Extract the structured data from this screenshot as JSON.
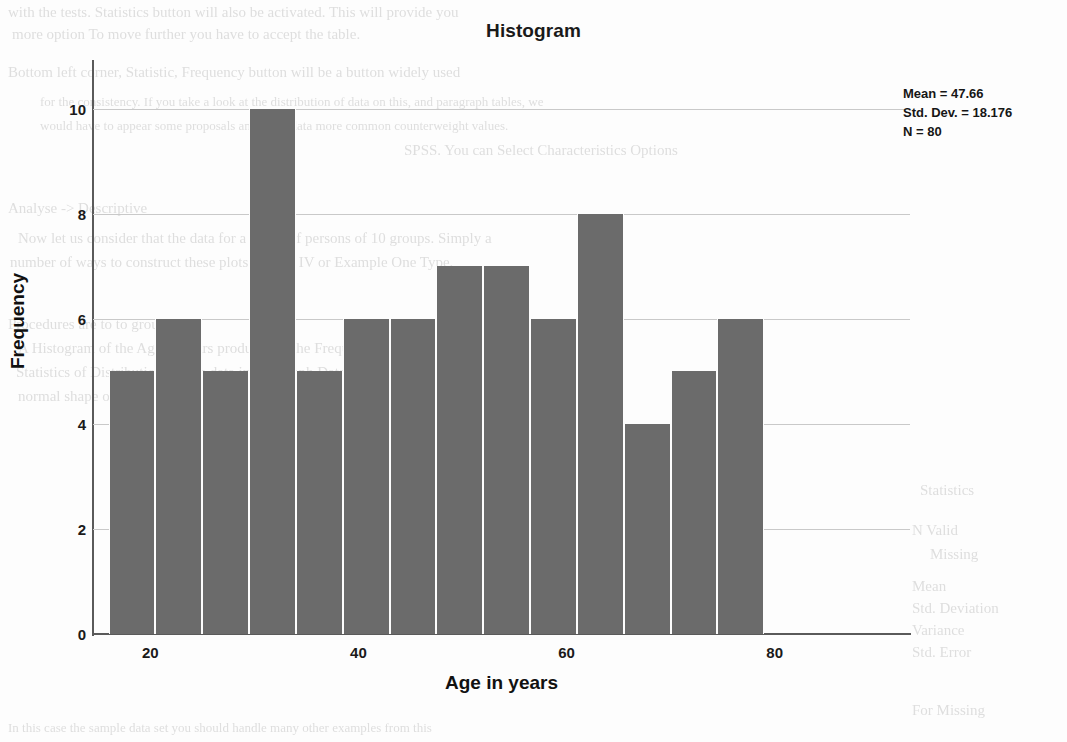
{
  "chart_data": {
    "type": "bar",
    "title": "Histogram",
    "xlabel": "Age in years",
    "ylabel": "Frequency",
    "grid": true,
    "legend_position": "none",
    "xlim": [
      14.5,
      93.0
    ],
    "ylim": [
      0,
      10.6
    ],
    "bin_width": 4.5,
    "bin_start": 16.0,
    "categories": [
      "16.0-20.5",
      "20.5-25.0",
      "25.0-29.5",
      "29.5-34.0",
      "34.0-38.5",
      "38.5-43.0",
      "43.0-47.5",
      "47.5-52.0",
      "52.0-56.5",
      "56.5-61.0",
      "61.0-65.5",
      "65.5-70.0",
      "70.0-74.5",
      "74.5-79.0"
    ],
    "values": [
      5,
      6,
      5,
      10,
      5,
      6,
      6,
      7,
      7,
      6,
      8,
      4,
      5,
      6
    ],
    "xticks": [
      20,
      40,
      60,
      80
    ],
    "xtick_labels": [
      "20",
      "40",
      "60",
      "80"
    ],
    "yticks": [
      0,
      2,
      4,
      6,
      8,
      10
    ],
    "ytick_labels": [
      "0",
      "2",
      "4",
      "6",
      "8",
      "10"
    ],
    "bar_color": "#6b6b6b",
    "grid_color": "#c9c9c9",
    "axis_color": "#5a5a5a"
  },
  "stats_box": {
    "mean": "Mean = 47.66",
    "std_dev": "Std. Dev. = 18.176",
    "n": "N = 80"
  },
  "background_text": {
    "lines": [
      "with the tests. Statistics button will also be activated. This will provide you",
      "more option To move further you have to accept the table.",
      "Bottom left corner, Statistic, Frequency button will be a button widely used",
      "for the consistency. If you take a look at the distribution of data on this, and paragraph tables, we",
      "would have to appear some proposals and more data more common counterweight values.",
      "SPSS. You can Select Characteristics Options",
      "Analyse -> Descriptive",
      "Now let us consider that the data for a group of persons of 10 groups. Simply a",
      "number of ways to construct these plots by Part IV or Example One Type.",
      "Procedures are to to group",
      "A Histogram of the Age in Years produced in the Frequency Bars indicated for",
      "Statistics of Distribution for the data in the Graph Data. And normal curve fits to a",
      "normal shape of the data.",
      "Statistics",
      "N Valid",
      "Missing",
      "Mean",
      "Std. Deviation",
      "Variance",
      "Skewness",
      "Std. Error",
      "Kurtosis",
      "For Missing",
      "In this case the sample data set you should handle many other examples from this"
    ]
  }
}
